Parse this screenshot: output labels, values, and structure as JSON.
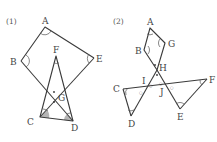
{
  "figures": [
    {
      "number": "(1)",
      "points": {
        "A": "A",
        "B": "B",
        "C": "C",
        "D": "D",
        "E": "E",
        "F": "F",
        "G": "G"
      }
    },
    {
      "number": "(2)",
      "points": {
        "A": "A",
        "B": "B",
        "C": "C",
        "D": "D",
        "E": "E",
        "F": "F",
        "G": "G",
        "H": "H",
        "I": "I",
        "J": "J"
      }
    }
  ]
}
